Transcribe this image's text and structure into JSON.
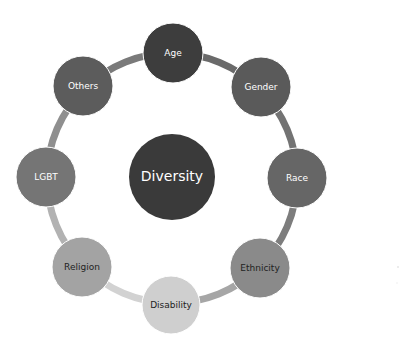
{
  "diagram": {
    "center": {
      "label": "Diversity",
      "x": 172,
      "y": 177,
      "r": 43,
      "fill": "#3a3a3a",
      "text": "#ffffff"
    },
    "ring": {
      "x": 172,
      "y": 178,
      "r": 125
    },
    "nodes": [
      {
        "label": "Age",
        "x": 173,
        "y": 53,
        "r": 30,
        "fill": "#3d3d3d",
        "text": "#ffffff",
        "arc": "#6a6a6a"
      },
      {
        "label": "Gender",
        "x": 261,
        "y": 87,
        "r": 30,
        "fill": "#5a5a5a",
        "text": "#ffffff",
        "arc": "#737373"
      },
      {
        "label": "Race",
        "x": 297,
        "y": 178,
        "r": 30,
        "fill": "#666666",
        "text": "#ffffff",
        "arc": "#7d7d7d"
      },
      {
        "label": "Ethnicity",
        "x": 260,
        "y": 268,
        "r": 30,
        "fill": "#8a8a8a",
        "text": "#222222",
        "arc": "#a6a6a6"
      },
      {
        "label": "Disability",
        "x": 171,
        "y": 305,
        "r": 29,
        "fill": "#cfcfcf",
        "text": "#222222",
        "arc": "#d2d2d2"
      },
      {
        "label": "Religion",
        "x": 82,
        "y": 267,
        "r": 30,
        "fill": "#a3a3a3",
        "text": "#222222",
        "arc": "#b2b2b2"
      },
      {
        "label": "LGBT",
        "x": 46,
        "y": 177,
        "r": 30,
        "fill": "#757575",
        "text": "#ffffff",
        "arc": "#8f8f8f"
      },
      {
        "label": "Others",
        "x": 83,
        "y": 86,
        "r": 30,
        "fill": "#5c5c5c",
        "text": "#ffffff",
        "arc": "#7a7a7a"
      }
    ]
  }
}
